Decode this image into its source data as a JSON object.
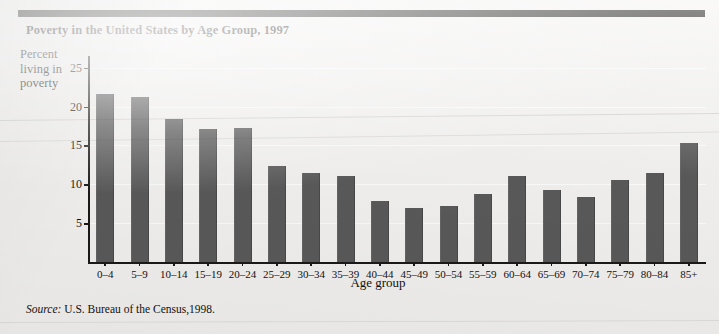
{
  "figure": {
    "title": "Poverty in the United States by Age Group, 1997",
    "source_word": "Source:",
    "source_text": " U.S. Bureau of the Census,1998."
  },
  "chart_data": {
    "type": "bar",
    "title": "Poverty in the United States by Age Group, 1997",
    "xlabel": "Age group",
    "ylabel": "Percent living in poverty",
    "ylabel_lines": [
      "Percent",
      "living in",
      "poverty"
    ],
    "categories": [
      "0–4",
      "5–9",
      "10–14",
      "15–19",
      "20–24",
      "25–29",
      "30–34",
      "35–39",
      "40–44",
      "45–49",
      "50–54",
      "55–59",
      "60–64",
      "65–69",
      "70–74",
      "75–79",
      "80–84",
      "85+"
    ],
    "values": [
      21.6,
      21.2,
      18.4,
      17.1,
      17.3,
      12.4,
      11.4,
      11.1,
      7.8,
      7.0,
      7.2,
      8.8,
      11.1,
      9.3,
      8.4,
      10.6,
      11.4,
      15.3
    ],
    "ylim": [
      0,
      26.5
    ],
    "yticks": [
      5,
      10,
      15,
      20,
      25
    ],
    "ytick_labels": [
      "5",
      "10",
      "15",
      "20",
      "25"
    ],
    "grid": true,
    "legend": "none",
    "bar_color": "#5a5a5a",
    "axis_color": "#1b1a18",
    "background_color": "#f3f2f0"
  }
}
